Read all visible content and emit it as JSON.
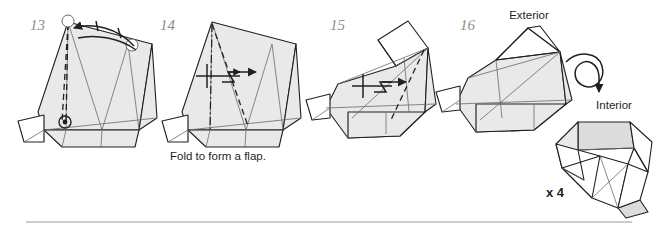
{
  "page": {
    "width": 658,
    "height": 235,
    "background": "#ffffff",
    "divider_color": "#9a9a9a",
    "paper_fill": "#e9e9e9",
    "ink_color": "#231f20",
    "step_number_color": "#8e8e8e"
  },
  "steps": [
    {
      "number": "13",
      "number_x": 30,
      "number_y": 30,
      "caption": "",
      "action": "rotate-flap-on-pivot"
    },
    {
      "number": "14",
      "number_x": 160,
      "number_y": 30,
      "caption": "Fold to form a flap.",
      "caption_x": 170,
      "caption_y": 160,
      "action": "push-pleat-right"
    },
    {
      "number": "15",
      "number_x": 330,
      "number_y": 30,
      "caption": "",
      "action": "push-pleat-right"
    },
    {
      "number": "16",
      "number_x": 460,
      "number_y": 30,
      "caption": "",
      "action": "turn-over"
    }
  ],
  "labels": {
    "exterior": "Exterior",
    "exterior_x": 529,
    "exterior_y": 19,
    "interior": "Interior",
    "interior_x": 614,
    "interior_y": 109,
    "multiplier": "x 4",
    "multiplier_x": 546,
    "multiplier_y": 197
  },
  "symbols": {
    "rotate_arrow": "turn-over-arrow",
    "pleat_arrow": "pleat-push-arrow",
    "pivot_marker": "pivot-point-marker",
    "fold_arrow": "fold-direction-arrow"
  }
}
